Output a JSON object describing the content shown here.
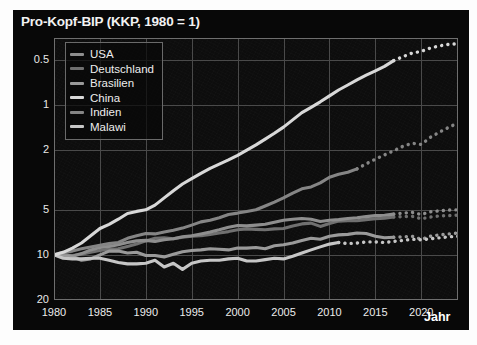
{
  "title": "Pro-Kopf-BIP (KKP, 1980 = 1)",
  "axis": {
    "x_name": "Jahr",
    "y_ticks": [
      "20",
      "10",
      "5",
      "2",
      "1",
      "0.5"
    ],
    "x_ticks": [
      "1980",
      "1985",
      "1990",
      "1995",
      "2000",
      "2005",
      "2010",
      "2015",
      "2020"
    ]
  },
  "legend": {
    "items": [
      {
        "label": "USA",
        "color": "#8e8e8e"
      },
      {
        "label": "Deutschland",
        "color": "#707070"
      },
      {
        "label": "Brasilien",
        "color": "#9a9a9a"
      },
      {
        "label": "China",
        "color": "#d8d8d8"
      },
      {
        "label": "Indien",
        "color": "#858585"
      },
      {
        "label": "Malawi",
        "color": "#c6c6c6"
      }
    ]
  },
  "chart_data": {
    "type": "line",
    "title": "Pro-Kopf-BIP (KKP, 1980 = 1)",
    "xlabel": "Jahr",
    "ylabel": "",
    "yscale": "log",
    "ylim": [
      0.5,
      28
    ],
    "xlim": [
      1980,
      2024
    ],
    "grid": true,
    "legend_position": "top-left",
    "y_tick_values": [
      0.5,
      1,
      2,
      5,
      10,
      20
    ],
    "x_tick_values": [
      1980,
      1985,
      1990,
      1995,
      2000,
      2005,
      2010,
      2015,
      2020
    ],
    "note": "Solid segments are historical data; dotted segments at the right are projections.",
    "x": [
      1980,
      1981,
      1982,
      1983,
      1984,
      1985,
      1986,
      1987,
      1988,
      1989,
      1990,
      1991,
      1992,
      1993,
      1994,
      1995,
      1996,
      1997,
      1998,
      1999,
      2000,
      2001,
      2002,
      2003,
      2004,
      2005,
      2006,
      2007,
      2008,
      2009,
      2010,
      2011,
      2012,
      2013,
      2014,
      2015,
      2016,
      2017,
      2018,
      2019,
      2020,
      2021,
      2022,
      2023,
      2024
    ],
    "series": [
      {
        "name": "China",
        "color": "#d8d8d8",
        "solid_until": 2017,
        "values": [
          1.0,
          1.04,
          1.11,
          1.2,
          1.34,
          1.5,
          1.6,
          1.73,
          1.89,
          1.95,
          2.0,
          2.15,
          2.4,
          2.68,
          2.97,
          3.23,
          3.5,
          3.78,
          4.03,
          4.3,
          4.62,
          5.0,
          5.42,
          5.92,
          6.48,
          7.12,
          7.95,
          8.9,
          9.65,
          10.5,
          11.5,
          12.6,
          13.6,
          14.7,
          15.8,
          16.9,
          18.1,
          19.8,
          21.0,
          22.2,
          22.8,
          24.0,
          24.8,
          25.4,
          25.6
        ]
      },
      {
        "name": "Indien",
        "color": "#858585",
        "solid_until": 2013,
        "values": [
          1.0,
          1.04,
          1.06,
          1.1,
          1.13,
          1.16,
          1.19,
          1.21,
          1.29,
          1.34,
          1.39,
          1.38,
          1.42,
          1.46,
          1.51,
          1.58,
          1.66,
          1.7,
          1.77,
          1.86,
          1.9,
          1.95,
          2.0,
          2.12,
          2.25,
          2.4,
          2.58,
          2.76,
          2.84,
          3.02,
          3.3,
          3.45,
          3.56,
          3.75,
          4.05,
          4.35,
          4.65,
          4.95,
          5.3,
          5.55,
          5.45,
          6.1,
          6.6,
          7.1,
          7.6
        ]
      },
      {
        "name": "Brasilien",
        "color": "#9a9a9a",
        "solid_until": 2017,
        "values": [
          1.0,
          0.98,
          0.97,
          0.92,
          0.94,
          1.0,
          1.06,
          1.06,
          1.03,
          1.04,
          0.99,
          0.99,
          0.97,
          1.01,
          1.05,
          1.07,
          1.08,
          1.1,
          1.09,
          1.08,
          1.11,
          1.11,
          1.12,
          1.1,
          1.15,
          1.17,
          1.2,
          1.25,
          1.29,
          1.27,
          1.33,
          1.36,
          1.37,
          1.4,
          1.39,
          1.33,
          1.3,
          1.31,
          1.32,
          1.33,
          1.27,
          1.33,
          1.36,
          1.38,
          1.4
        ]
      },
      {
        "name": "USA",
        "color": "#8e8e8e",
        "solid_until": 2017,
        "values": [
          1.0,
          1.01,
          0.98,
          1.02,
          1.08,
          1.12,
          1.14,
          1.17,
          1.21,
          1.24,
          1.25,
          1.23,
          1.26,
          1.28,
          1.32,
          1.34,
          1.38,
          1.42,
          1.47,
          1.53,
          1.57,
          1.56,
          1.58,
          1.6,
          1.65,
          1.7,
          1.73,
          1.75,
          1.73,
          1.67,
          1.7,
          1.72,
          1.75,
          1.77,
          1.8,
          1.83,
          1.84,
          1.87,
          1.9,
          1.92,
          1.86,
          1.94,
          1.97,
          1.99,
          2.0
        ]
      },
      {
        "name": "Deutschland",
        "color": "#707070",
        "solid_until": 2017,
        "values": [
          1.0,
          1.0,
          0.99,
          1.01,
          1.04,
          1.07,
          1.09,
          1.1,
          1.14,
          1.18,
          1.24,
          1.29,
          1.3,
          1.28,
          1.31,
          1.33,
          1.34,
          1.37,
          1.4,
          1.43,
          1.47,
          1.49,
          1.48,
          1.47,
          1.49,
          1.5,
          1.56,
          1.61,
          1.63,
          1.55,
          1.62,
          1.68,
          1.69,
          1.69,
          1.72,
          1.74,
          1.76,
          1.79,
          1.8,
          1.81,
          1.74,
          1.79,
          1.82,
          1.83,
          1.84
        ]
      },
      {
        "name": "Malawi",
        "color": "#c6c6c6",
        "solid_until": 2011,
        "values": [
          1.0,
          0.95,
          0.94,
          0.94,
          0.95,
          0.95,
          0.92,
          0.89,
          0.87,
          0.87,
          0.88,
          0.92,
          0.83,
          0.88,
          0.8,
          0.88,
          0.91,
          0.92,
          0.92,
          0.94,
          0.95,
          0.91,
          0.91,
          0.93,
          0.95,
          0.94,
          0.98,
          1.03,
          1.08,
          1.13,
          1.18,
          1.21,
          1.19,
          1.2,
          1.22,
          1.22,
          1.21,
          1.23,
          1.25,
          1.27,
          1.26,
          1.28,
          1.3,
          1.32,
          1.33
        ]
      }
    ]
  }
}
